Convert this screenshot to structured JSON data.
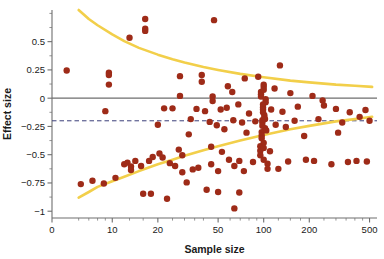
{
  "chart_data": {
    "type": "scatter",
    "title": "",
    "xlabel": "Sample size",
    "ylabel": "Effect size",
    "xscale": "log",
    "xlim": [
      4,
      560
    ],
    "ylim": [
      -1.06,
      0.78
    ],
    "grid": false,
    "legend": "none",
    "xticks": [
      {
        "value": 4,
        "label": "0"
      },
      {
        "value": 10,
        "label": "10"
      },
      {
        "value": 20,
        "label": "20"
      },
      {
        "value": 50,
        "label": "50"
      },
      {
        "value": 100,
        "label": "100"
      },
      {
        "value": 200,
        "label": "200"
      },
      {
        "value": 500,
        "label": "500"
      }
    ],
    "xminorticks": [
      6,
      7,
      8,
      9,
      13,
      16,
      25,
      30,
      35,
      40,
      60,
      70,
      80,
      90,
      125,
      150,
      175,
      250,
      300,
      350,
      400,
      450
    ],
    "yticks": [
      0.5,
      0.25,
      0,
      -0.25,
      -0.5,
      -0.75,
      -1
    ],
    "yticklabels": [
      "0.5",
      "0.25",
      "0",
      "−0.25",
      "−0.5",
      "−0.75",
      "−1"
    ],
    "yminorticks": [
      0.75,
      0.625,
      0.375,
      0.125,
      -0.125,
      -0.375,
      -0.625,
      -0.875
    ],
    "reference_lines": [
      {
        "name": "zero-line",
        "y": 0,
        "style": "solid",
        "color": "#6e6e6e"
      },
      {
        "name": "pooled-effect-line",
        "y": -0.2,
        "style": "dashed",
        "color": "#3b3f7a"
      }
    ],
    "curves": [
      {
        "name": "upper-bound-curve",
        "color": "#f2cf4a",
        "points": [
          [
            6,
            0.78
          ],
          [
            7,
            0.7
          ],
          [
            8,
            0.645
          ],
          [
            10,
            0.565
          ],
          [
            12,
            0.505
          ],
          [
            15,
            0.445
          ],
          [
            20,
            0.385
          ],
          [
            25,
            0.345
          ],
          [
            30,
            0.315
          ],
          [
            40,
            0.275
          ],
          [
            50,
            0.25
          ],
          [
            70,
            0.215
          ],
          [
            100,
            0.185
          ],
          [
            150,
            0.155
          ],
          [
            200,
            0.14
          ],
          [
            300,
            0.12
          ],
          [
            400,
            0.11
          ],
          [
            520,
            0.1
          ]
        ]
      },
      {
        "name": "lower-bound-curve",
        "color": "#f2cf4a",
        "points": [
          [
            6,
            -0.88
          ],
          [
            7,
            -0.83
          ],
          [
            8,
            -0.785
          ],
          [
            10,
            -0.735
          ],
          [
            12,
            -0.695
          ],
          [
            15,
            -0.645
          ],
          [
            20,
            -0.585
          ],
          [
            25,
            -0.545
          ],
          [
            30,
            -0.51
          ],
          [
            40,
            -0.46
          ],
          [
            50,
            -0.425
          ],
          [
            70,
            -0.375
          ],
          [
            100,
            -0.325
          ],
          [
            150,
            -0.275
          ],
          [
            200,
            -0.245
          ],
          [
            300,
            -0.205
          ],
          [
            400,
            -0.185
          ],
          [
            520,
            -0.165
          ]
        ]
      }
    ],
    "point_color": "#9e2b18",
    "point_size": 3.2,
    "points": [
      [
        5.0,
        0.245
      ],
      [
        9.5,
        0.225
      ],
      [
        9.5,
        0.205
      ],
      [
        9.5,
        0.12
      ],
      [
        13.0,
        0.535
      ],
      [
        16.5,
        0.7
      ],
      [
        16.5,
        0.615
      ],
      [
        16.5,
        0.595
      ],
      [
        28.0,
        0.195
      ],
      [
        28.0,
        0.02
      ],
      [
        39.0,
        0.205
      ],
      [
        39.0,
        0.145
      ],
      [
        47.0,
        0.69
      ],
      [
        46.0,
        0.015
      ],
      [
        46.0,
        -0.025
      ],
      [
        62.0,
        0.055
      ],
      [
        58.0,
        0.105
      ],
      [
        75.0,
        0.175
      ],
      [
        92.0,
        0.19
      ],
      [
        96.0,
        0.055
      ],
      [
        96.0,
        0.035
      ],
      [
        96.0,
        0.015
      ],
      [
        100.0,
        0.12
      ],
      [
        100.0,
        0.1
      ],
      [
        100.0,
        0.075
      ],
      [
        103.0,
        -0.01
      ],
      [
        103.0,
        -0.035
      ],
      [
        118.0,
        0.085
      ],
      [
        128.0,
        0.29
      ],
      [
        150.0,
        0.045
      ],
      [
        210.0,
        0.02
      ],
      [
        245.0,
        -0.02
      ],
      [
        9.0,
        -0.115
      ],
      [
        22.0,
        -0.09
      ],
      [
        25.0,
        -0.09
      ],
      [
        36.0,
        -0.095
      ],
      [
        41.0,
        -0.115
      ],
      [
        52.0,
        -0.1
      ],
      [
        57.0,
        -0.085
      ],
      [
        68.0,
        -0.055
      ],
      [
        80.0,
        -0.135
      ],
      [
        99.0,
        -0.055
      ],
      [
        99.0,
        -0.08
      ],
      [
        99.0,
        -0.1
      ],
      [
        99.0,
        -0.125
      ],
      [
        101.0,
        -0.15
      ],
      [
        101.0,
        -0.175
      ],
      [
        112.0,
        -0.1
      ],
      [
        133.0,
        -0.12
      ],
      [
        168.0,
        -0.075
      ],
      [
        250.0,
        -0.065
      ],
      [
        300.0,
        -0.095
      ],
      [
        370.0,
        -0.125
      ],
      [
        430.0,
        -0.165
      ],
      [
        470.0,
        -0.105
      ],
      [
        20.0,
        -0.235
      ],
      [
        33.0,
        -0.185
      ],
      [
        44.0,
        -0.21
      ],
      [
        49.0,
        -0.24
      ],
      [
        63.0,
        -0.195
      ],
      [
        72.0,
        -0.215
      ],
      [
        88.0,
        -0.205
      ],
      [
        98.0,
        -0.195
      ],
      [
        98.0,
        -0.215
      ],
      [
        98.0,
        -0.245
      ],
      [
        102.0,
        -0.185
      ],
      [
        102.0,
        -0.265
      ],
      [
        120.0,
        -0.235
      ],
      [
        160.0,
        -0.2
      ],
      [
        230.0,
        -0.185
      ],
      [
        330.0,
        -0.215
      ],
      [
        500.0,
        -0.2
      ],
      [
        32.0,
        -0.32
      ],
      [
        55.0,
        -0.275
      ],
      [
        77.0,
        -0.305
      ],
      [
        97.0,
        -0.3
      ],
      [
        97.0,
        -0.33
      ],
      [
        97.0,
        -0.355
      ],
      [
        104.0,
        -0.285
      ],
      [
        140.0,
        -0.255
      ],
      [
        185.0,
        -0.335
      ],
      [
        310.0,
        -0.305
      ],
      [
        6.2,
        -0.76
      ],
      [
        7.4,
        -0.73
      ],
      [
        8.8,
        -0.755
      ],
      [
        10.5,
        -0.705
      ],
      [
        12.0,
        -0.585
      ],
      [
        12.6,
        -0.57
      ],
      [
        13.3,
        -0.605
      ],
      [
        13.3,
        -0.635
      ],
      [
        14.2,
        -0.555
      ],
      [
        15.5,
        -0.6
      ],
      [
        16.0,
        -0.845
      ],
      [
        18.0,
        -0.845
      ],
      [
        17.5,
        -0.555
      ],
      [
        18.5,
        -0.52
      ],
      [
        20.5,
        -0.49
      ],
      [
        21.5,
        -0.525
      ],
      [
        23.0,
        -0.89
      ],
      [
        24.0,
        -0.575
      ],
      [
        26.0,
        -0.6
      ],
      [
        27.5,
        -0.455
      ],
      [
        29.0,
        -0.505
      ],
      [
        29.0,
        -0.655
      ],
      [
        31.0,
        -0.745
      ],
      [
        34.0,
        -0.63
      ],
      [
        37.0,
        -0.615
      ],
      [
        42.0,
        -0.81
      ],
      [
        45.0,
        -0.585
      ],
      [
        45.0,
        -0.43
      ],
      [
        50.0,
        -0.645
      ],
      [
        50.0,
        -0.83
      ],
      [
        53.0,
        -0.475
      ],
      [
        59.0,
        -0.545
      ],
      [
        64.0,
        -0.6
      ],
      [
        64.0,
        -0.975
      ],
      [
        69.0,
        -0.555
      ],
      [
        69.0,
        -0.835
      ],
      [
        74.0,
        -0.645
      ],
      [
        85.0,
        -0.565
      ],
      [
        95.0,
        -0.425
      ],
      [
        95.0,
        -0.465
      ],
      [
        95.0,
        -0.505
      ],
      [
        100.0,
        -0.395
      ],
      [
        100.0,
        -0.44
      ],
      [
        100.0,
        -0.545
      ],
      [
        106.0,
        -0.58
      ],
      [
        106.0,
        -0.625
      ],
      [
        110.0,
        -0.47
      ],
      [
        125.0,
        -0.625
      ],
      [
        145.0,
        -0.56
      ],
      [
        190.0,
        -0.545
      ],
      [
        215.0,
        -0.555
      ],
      [
        280.0,
        -0.585
      ],
      [
        360.0,
        -0.565
      ],
      [
        410.0,
        -0.555
      ],
      [
        480.0,
        -0.56
      ]
    ]
  }
}
